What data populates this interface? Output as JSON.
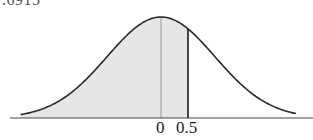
{
  "chart_data": {
    "type": "area",
    "title": "",
    "subtitle": "",
    "distribution": "standard normal",
    "annotation_top": ".6915",
    "shaded_region": {
      "from": "-inf",
      "to": 0.5,
      "area": 0.6915
    },
    "x_ticks": [
      "0",
      "0.5"
    ],
    "x_tick_values": [
      0,
      0.5
    ],
    "reference_lines": [
      {
        "x": 0,
        "style": "gray",
        "label": "mean"
      },
      {
        "x": 0.5,
        "style": "black",
        "label": "z = 0.5"
      }
    ],
    "xlabel": "",
    "ylabel": "",
    "xlim": [
      -3.5,
      3.5
    ],
    "grid": false,
    "legend": false
  },
  "labels": {
    "top": ".6915",
    "tick_zero": "0",
    "tick_half": "0.5"
  },
  "colors": {
    "curve": "#2a2a2a",
    "shade": "#e6e6e6",
    "mean_line": "#9a9a9a",
    "cut_line": "#1a1a1a",
    "axis": "#444444"
  }
}
